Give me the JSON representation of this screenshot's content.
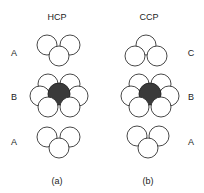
{
  "figure": {
    "panels": [
      {
        "id": "a",
        "title": "HCP",
        "caption": "(a)",
        "layers": [
          {
            "label": "A",
            "position": "top"
          },
          {
            "label": "B",
            "position": "middle"
          },
          {
            "label": "A",
            "position": "bottom"
          }
        ]
      },
      {
        "id": "b",
        "title": "CCP",
        "caption": "(b)",
        "layers": [
          {
            "label": "C",
            "position": "top"
          },
          {
            "label": "B",
            "position": "middle"
          },
          {
            "label": "A",
            "position": "bottom"
          }
        ]
      }
    ],
    "colors": {
      "sphere_fill": "#ffffff",
      "sphere_stroke": "#333333",
      "central_sphere_fill": "#3a3a3a",
      "text": "#222222"
    }
  }
}
